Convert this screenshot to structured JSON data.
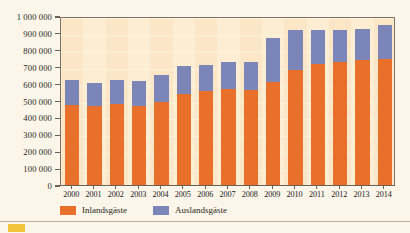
{
  "chart_data": {
    "type": "bar",
    "stacked": true,
    "title": "",
    "subtitle": "",
    "xlabel": "",
    "ylabel": "",
    "ylim": [
      0,
      1000000
    ],
    "ytick_values": [
      0,
      100000,
      200000,
      300000,
      400000,
      500000,
      600000,
      700000,
      800000,
      900000,
      1000000
    ],
    "ytick_labels": [
      "0",
      "100 000",
      "200 000",
      "300 000",
      "400 000",
      "500 000",
      "600 000",
      "700 000",
      "800 000",
      "900 000",
      "1 000 000"
    ],
    "grid": true,
    "legend_position": "bottom-left",
    "categories": [
      "2000",
      "2001",
      "2002",
      "2003",
      "2004",
      "2005",
      "2006",
      "2007",
      "2008",
      "2009",
      "2010",
      "2011",
      "2012",
      "2013",
      "2014"
    ],
    "series": [
      {
        "name": "Inlandsgäste",
        "color": "#e8702a",
        "values": [
          475000,
          470000,
          480000,
          465000,
          490000,
          540000,
          555000,
          570000,
          565000,
          610000,
          680000,
          715000,
          725000,
          740000,
          745000
        ]
      },
      {
        "name": "Auslandsgäste",
        "color": "#7b85b8",
        "values": [
          145000,
          135000,
          140000,
          150000,
          160000,
          165000,
          155000,
          160000,
          165000,
          260000,
          240000,
          205000,
          190000,
          185000,
          200000
        ]
      }
    ],
    "totals": [
      620000,
      605000,
      620000,
      615000,
      650000,
      705000,
      710000,
      730000,
      730000,
      870000,
      920000,
      920000,
      915000,
      925000,
      945000
    ]
  },
  "legend": {
    "entries": [
      {
        "label": "Inlandsgäste",
        "color": "#e8702a",
        "swatch_name": "legend-swatch-inland"
      },
      {
        "label": "Auslandsgäste",
        "color": "#7b85b8",
        "swatch_name": "legend-swatch-ausland"
      }
    ]
  },
  "colors": {
    "inland": "#e8702a",
    "ausland": "#7b85b8",
    "plot_background": "#fbe6c8",
    "page_background": "#fbf6e9",
    "axis": "#6a6254"
  },
  "footer": {
    "text": ""
  }
}
